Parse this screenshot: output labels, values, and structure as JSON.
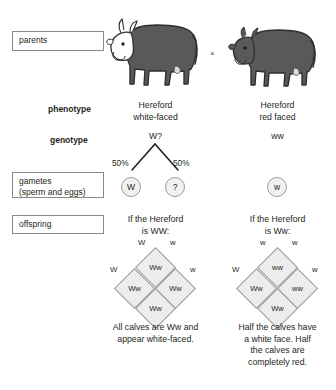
{
  "diagram": {
    "cross_symbol": "×"
  },
  "row_boxes": {
    "parents": "parents",
    "gametes_line1": "gametes",
    "gametes_line2": "(sperm and eggs)",
    "offspring": "offspring"
  },
  "row_labels": {
    "phenotype": "phenotype",
    "genotype": "genotype"
  },
  "parents": {
    "left": {
      "name": "Hereford white-faced cow",
      "phenotype_line1": "Hereford",
      "phenotype_line2": "white-faced",
      "genotype": "W?",
      "body_color": "#59595b",
      "face_color": "#ffffff"
    },
    "right": {
      "name": "Hereford red faced cow",
      "phenotype_line1": "Hereford",
      "phenotype_line2": "red faced",
      "genotype": "ww",
      "body_color": "#59595b",
      "face_color": "#59595b"
    }
  },
  "gametes": {
    "left_parent": {
      "percent_left": "50%",
      "percent_right": "50%",
      "allele_left": "W",
      "allele_right": "?"
    },
    "right_parent": {
      "allele": "w"
    }
  },
  "offspring": {
    "left": {
      "heading_line1": "If the Hereford",
      "heading_line2": "is WW:",
      "punnett": {
        "label_top_left": "W",
        "label_top_right": "w",
        "label_left": "W",
        "label_right": "w",
        "cell_top": "Ww",
        "cell_left": "Ww",
        "cell_right": "Ww",
        "cell_bottom": "Ww"
      },
      "caption_line1": "All calves are Ww and",
      "caption_line2": "appear white-faced."
    },
    "right": {
      "heading_line1": "If the Hereford",
      "heading_line2": "is Ww:",
      "punnett": {
        "label_top_left": "w",
        "label_top_right": "w",
        "label_left": "W",
        "label_right": "w",
        "cell_top": "ww",
        "cell_left": "Ww",
        "cell_right": "ww",
        "cell_bottom": "Ww"
      },
      "caption_line1": "Half the calves have",
      "caption_line2": "a white face. Half",
      "caption_line3": "the calves are",
      "caption_line4": "completely red."
    }
  },
  "colors": {
    "box_border": "#8a8a8a",
    "text": "#231f20",
    "cell_fill": "#ededed",
    "cell_border": "#9b9b9b"
  }
}
